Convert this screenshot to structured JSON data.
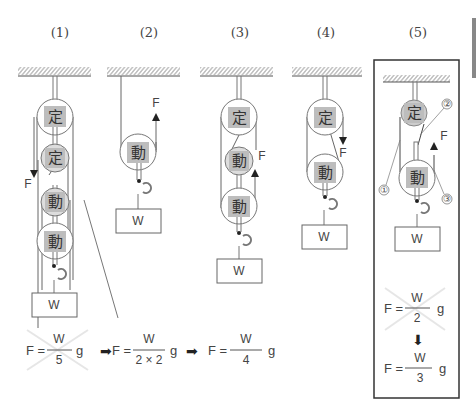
{
  "diagram": {
    "panels": [
      {
        "label": "(1)",
        "pulleys": [
          "定",
          "定",
          "動",
          "動"
        ],
        "force": "F",
        "force_dir": "down",
        "weight": "W"
      },
      {
        "label": "(2)",
        "pulleys": [
          "動"
        ],
        "force": "F",
        "force_dir": "up",
        "weight": "W"
      },
      {
        "label": "(3)",
        "pulleys": [
          "定",
          "動",
          "動"
        ],
        "force": "F",
        "force_dir": "up",
        "weight": "W"
      },
      {
        "label": "(4)",
        "pulleys": [
          "定",
          "動"
        ],
        "force": "F",
        "force_dir": "down",
        "weight": "W"
      },
      {
        "label": "(5)",
        "pulleys": [
          "定",
          "動"
        ],
        "force": "F",
        "force_dir": "up",
        "weight": "W",
        "markers": [
          "①",
          "②",
          "③"
        ],
        "highlighted": true
      }
    ],
    "fixed_label": "定",
    "moving_label": "動",
    "weight_label": "W",
    "force_label": "F",
    "equation_row": {
      "eq1": {
        "lhs": "F =",
        "num": "W",
        "den": "5",
        "g": "g",
        "crossed": true
      },
      "eq2": {
        "lhs": "F =",
        "num": "W",
        "den": "2 × 2",
        "g": "g"
      },
      "eq3": {
        "lhs": "F =",
        "num": "W",
        "den": "4",
        "g": "g"
      },
      "arrow": "➡"
    },
    "box_equations": {
      "eq1": {
        "lhs": "F =",
        "num": "W",
        "den": "2",
        "g": "g",
        "crossed": true
      },
      "arrow": "⬇",
      "eq2": {
        "lhs": "F =",
        "num": "W",
        "den": "3",
        "g": "g"
      }
    },
    "colors": {
      "line": "#666666",
      "label_fill": "#bdbdbd",
      "box_border": "#333333",
      "cross": "#e6e6e6"
    }
  }
}
